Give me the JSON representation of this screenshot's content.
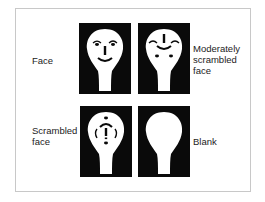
{
  "figure": {
    "panels": [
      {
        "id": "face",
        "label": "Face",
        "position": "top-left"
      },
      {
        "id": "moderately-scrambled",
        "label": "Moderately scrambled face",
        "label_lines": [
          "Moderately",
          "scrambled",
          "face"
        ],
        "position": "top-right"
      },
      {
        "id": "scrambled",
        "label": "Scrambled face",
        "label_lines": [
          "Scrambled",
          "face"
        ],
        "position": "bottom-left"
      },
      {
        "id": "blank",
        "label": "Blank",
        "position": "bottom-right"
      }
    ],
    "colors": {
      "panel_bg": "#0a0a0a",
      "face_fill": "#ffffff",
      "feature": "#0a0a0a",
      "frame_border": "#c8c8c8"
    }
  }
}
